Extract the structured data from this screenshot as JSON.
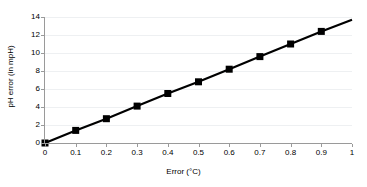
{
  "chart_data": {
    "type": "line",
    "title": "",
    "xlabel": "Error (°C)",
    "ylabel": "pH error (in mpH)",
    "xlim": [
      0,
      1
    ],
    "ylim": [
      0,
      14
    ],
    "grid": true,
    "legend": false,
    "marker": "square",
    "marker_color": "#000000",
    "line_color": "#000000",
    "gridline_color": "#eef0f2",
    "axis_color": "#9a9a9a",
    "x_ticks": [
      "0",
      "0.1",
      "0.2",
      "0.3",
      "0.4",
      "0.5",
      "0.6",
      "0.7",
      "0.8",
      "0.9",
      "1"
    ],
    "y_ticks": [
      "0",
      "2",
      "4",
      "6",
      "8",
      "10",
      "12",
      "14"
    ],
    "x_tick_values": [
      0,
      0.1,
      0.2,
      0.3,
      0.4,
      0.5,
      0.6,
      0.7,
      0.8,
      0.9,
      1
    ],
    "y_tick_values": [
      0,
      2,
      4,
      6,
      8,
      10,
      12,
      14
    ],
    "x": [
      0,
      0.1,
      0.2,
      0.3,
      0.4,
      0.5,
      0.6,
      0.7,
      0.8,
      0.9,
      1.0
    ],
    "values": [
      0.0,
      1.4,
      2.7,
      4.1,
      5.5,
      6.8,
      8.2,
      9.6,
      11.0,
      12.4,
      13.7
    ],
    "marker_x": [
      0,
      0.1,
      0.2,
      0.3,
      0.4,
      0.5,
      0.6,
      0.7,
      0.8,
      0.9
    ],
    "marker_values": [
      0.0,
      1.4,
      2.7,
      4.1,
      5.5,
      6.8,
      8.2,
      9.6,
      11.0,
      12.4
    ],
    "series": [
      {
        "name": "pH error",
        "x": [
          0,
          0.1,
          0.2,
          0.3,
          0.4,
          0.5,
          0.6,
          0.7,
          0.8,
          0.9,
          1.0
        ],
        "values": [
          0.0,
          1.4,
          2.7,
          4.1,
          5.5,
          6.8,
          8.2,
          9.6,
          11.0,
          12.4,
          13.7
        ]
      }
    ]
  }
}
